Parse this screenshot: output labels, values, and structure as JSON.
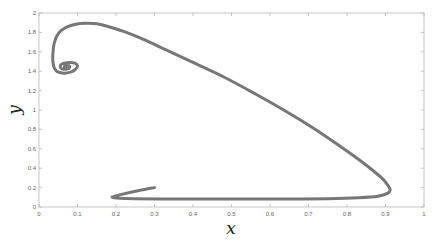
{
  "chart_data": {
    "type": "line",
    "title": "",
    "xlabel": "x",
    "ylabel": "y",
    "xlim": [
      0,
      1
    ],
    "ylim": [
      0,
      2
    ],
    "xticks": [
      "0",
      "0.1",
      "0.2",
      "0.3",
      "0.4",
      "0.5",
      "0.6",
      "0.7",
      "0.8",
      "0.9",
      "1"
    ],
    "xtick_values": [
      0,
      0.1,
      0.2,
      0.3,
      0.4,
      0.5,
      0.6,
      0.7,
      0.8,
      0.9,
      1
    ],
    "yticks": [
      "0",
      "0.2",
      "0.4",
      "0.6",
      "0.8",
      "1",
      "1.2",
      "1.4",
      "1.6",
      "1.8",
      "2"
    ],
    "ytick_values": [
      0,
      0.2,
      0.4,
      0.6,
      0.8,
      1,
      1.2,
      1.4,
      1.6,
      1.8,
      2
    ],
    "grid": false,
    "legend": "none",
    "series": [
      {
        "name": "trajectory",
        "color": "#777777",
        "x": [
          0.3,
          0.26,
          0.22,
          0.195,
          0.19,
          0.2,
          0.25,
          0.35,
          0.45,
          0.55,
          0.65,
          0.75,
          0.83,
          0.88,
          0.905,
          0.912,
          0.905,
          0.89,
          0.86,
          0.82,
          0.77,
          0.71,
          0.64,
          0.56,
          0.48,
          0.4,
          0.33,
          0.27,
          0.22,
          0.18,
          0.15,
          0.12,
          0.095,
          0.075,
          0.058,
          0.046,
          0.039,
          0.036,
          0.036,
          0.04,
          0.05,
          0.065,
          0.082,
          0.095,
          0.1,
          0.095,
          0.082,
          0.068,
          0.058,
          0.055,
          0.06,
          0.07,
          0.078,
          0.08,
          0.075,
          0.068,
          0.066,
          0.07
        ],
        "y": [
          0.2,
          0.17,
          0.135,
          0.11,
          0.1,
          0.092,
          0.085,
          0.082,
          0.082,
          0.082,
          0.083,
          0.086,
          0.095,
          0.11,
          0.14,
          0.18,
          0.23,
          0.3,
          0.4,
          0.52,
          0.66,
          0.82,
          0.99,
          1.17,
          1.34,
          1.49,
          1.62,
          1.73,
          1.81,
          1.86,
          1.89,
          1.895,
          1.885,
          1.86,
          1.82,
          1.76,
          1.68,
          1.58,
          1.5,
          1.43,
          1.39,
          1.38,
          1.39,
          1.42,
          1.45,
          1.48,
          1.49,
          1.485,
          1.47,
          1.445,
          1.425,
          1.42,
          1.43,
          1.45,
          1.46,
          1.455,
          1.44,
          1.435
        ]
      }
    ]
  }
}
